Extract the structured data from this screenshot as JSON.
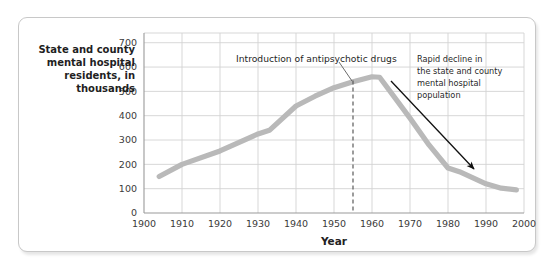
{
  "chart_data": {
    "type": "line",
    "title": "",
    "xlabel": "Year",
    "ylabel": "State and county mental hospital residents, in thousands",
    "ylabel_lines": [
      "State and county",
      "mental hospital",
      "residents, in",
      "thousands"
    ],
    "xlim": [
      1900,
      2000
    ],
    "ylim": [
      0,
      740
    ],
    "grid": true,
    "legend": "none",
    "line_color": "#b9b9b9",
    "xticks": [
      1900,
      1910,
      1920,
      1930,
      1940,
      1950,
      1960,
      1970,
      1980,
      1990,
      2000
    ],
    "xtick_labels": [
      "1900",
      "1910",
      "1920",
      "1930",
      "1940",
      "1950",
      "1960",
      "1970",
      "1980",
      "1990",
      "2000"
    ],
    "yticks": [
      0,
      100,
      200,
      300,
      400,
      500,
      600,
      700
    ],
    "ytick_labels": [
      "0",
      "100",
      "200",
      "300",
      "400",
      "500",
      "600",
      "700"
    ],
    "series": [
      {
        "name": "State and county mental hospital residents",
        "x": [
          1904,
          1910,
          1920,
          1930,
          1933,
          1940,
          1945,
          1950,
          1955,
          1960,
          1962,
          1970,
          1975,
          1980,
          1983,
          1990,
          1994,
          1998
        ],
        "values": [
          150,
          200,
          255,
          325,
          340,
          440,
          480,
          515,
          540,
          560,
          558,
          390,
          280,
          185,
          170,
          120,
          102,
          95
        ]
      }
    ],
    "annotations": [
      {
        "name": "antipsychotic-drugs",
        "text": "Introduction of antipsychotic drugs",
        "marker_year": 1955,
        "marker_style": "dashed-vertical-line"
      },
      {
        "name": "rapid-decline",
        "text": "Rapid decline in the state and county mental hospital population",
        "lines": [
          "Rapid decline in",
          "the state and county",
          "mental hospital",
          "population"
        ],
        "marker_style": "arrow",
        "arrow_from_year": 1964,
        "arrow_from_value": 590,
        "arrow_to_year": 1988,
        "arrow_to_value": 195
      }
    ]
  },
  "colors": {
    "line": "#b9b9b9",
    "grid": "#d2d2d2",
    "axis": "#9a9a9a",
    "text": "#1f1f1f",
    "card_border": "#c8c8c8",
    "background": "#ffffff"
  }
}
